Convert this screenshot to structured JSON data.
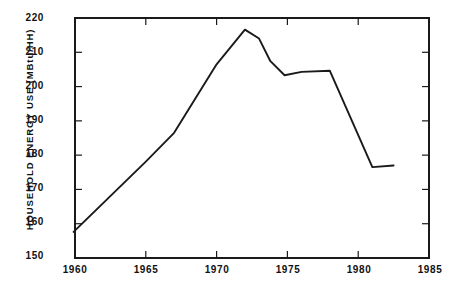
{
  "chart_data": {
    "type": "line",
    "title": "",
    "xlabel": "",
    "ylabel": "HOUSEHOLD ENERGY USE (MBtu/HH)",
    "xlim": [
      1960,
      1985
    ],
    "ylim": [
      150,
      220
    ],
    "grid": false,
    "legend": null,
    "xticks": [
      1960,
      1965,
      1970,
      1975,
      1980,
      1985
    ],
    "xtick_labels": [
      "1960",
      "1965",
      "1970",
      "1975",
      "1980",
      "1985"
    ],
    "yticks": [
      150,
      160,
      170,
      180,
      190,
      200,
      210,
      220
    ],
    "ytick_labels": [
      "150",
      "160",
      "170",
      "180",
      "190",
      "200",
      "210",
      "220"
    ],
    "series": [
      {
        "name": "Household energy use",
        "color": "#1a1a1a",
        "x": [
          1959.9,
          1965.0,
          1967.0,
          1970.0,
          1972.0,
          1973.0,
          1973.8,
          1974.8,
          1976.0,
          1978.0,
          1981.0,
          1982.5
        ],
        "y": [
          157.6,
          178.1,
          186.5,
          206.5,
          216.6,
          214.0,
          207.4,
          203.3,
          204.3,
          204.6,
          176.5,
          177.0
        ]
      }
    ]
  },
  "axes": {
    "frame_color": "#1a1a1a"
  }
}
